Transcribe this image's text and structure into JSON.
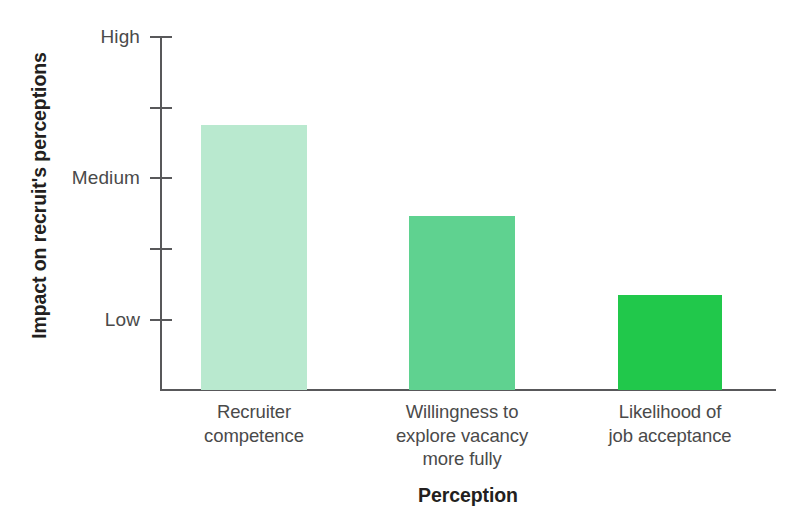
{
  "chart_data": {
    "type": "bar",
    "title": "",
    "xlabel": "Perception",
    "ylabel": "Impact on recruit's perceptions",
    "categories": [
      "Recruiter\ncompetence",
      "Willingness to\nexplore vacancy\nmore fully",
      "Likelihood of\njob acceptance"
    ],
    "values": [
      3.74,
      2.45,
      1.34
    ],
    "value_labels": [
      "",
      "",
      ""
    ],
    "ylim": [
      0,
      5
    ],
    "ytick_values": [
      5,
      4,
      3,
      2,
      1
    ],
    "ytick_labels": [
      "High",
      "",
      "Medium",
      "",
      "Low"
    ],
    "grid": false,
    "legend": "none",
    "series": [
      {
        "name": "Impact on recruit's perceptions",
        "values": [
          3.74,
          2.45,
          1.34
        ]
      }
    ],
    "bar_colors": [
      "#b9e9cf",
      "#5fd290",
      "#21c84b"
    ]
  },
  "axes": {
    "y_title": "Impact on recruit's perceptions",
    "x_title": "Perception",
    "y_ticks": [
      {
        "label": "High",
        "value": 5,
        "labeled": true
      },
      {
        "label": "",
        "value": 4,
        "labeled": false
      },
      {
        "label": "Medium",
        "value": 3,
        "labeled": true
      },
      {
        "label": "",
        "value": 2,
        "labeled": false
      },
      {
        "label": "Low",
        "value": 1,
        "labeled": true
      }
    ]
  },
  "bars": [
    {
      "category_line1": "Recruiter",
      "category_line2": "competence",
      "category_line3": "",
      "value": 3.74,
      "color": "#b9e9cf"
    },
    {
      "category_line1": "Willingness to",
      "category_line2": "explore vacancy",
      "category_line3": "more fully",
      "value": 2.45,
      "color": "#5fd290"
    },
    {
      "category_line1": "Likelihood of",
      "category_line2": "job acceptance",
      "category_line3": "",
      "value": 1.34,
      "color": "#21c84b"
    }
  ],
  "colors": {
    "axis": "#58585a",
    "text": "#4a4a4a",
    "title_text": "#231f20",
    "background": "#ffffff"
  }
}
